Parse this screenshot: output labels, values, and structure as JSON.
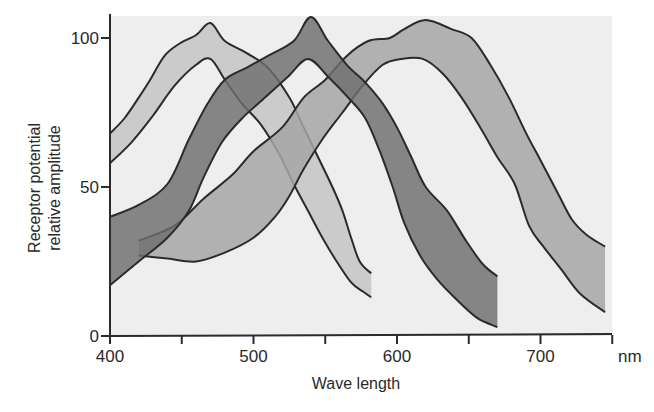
{
  "chart_data": {
    "type": "area",
    "title": "",
    "xlabel": "Wave length",
    "xunit": "nm",
    "ylabel": [
      "Receptor potential",
      "relative amplitude"
    ],
    "xlim": [
      400,
      750
    ],
    "ylim": [
      0,
      105
    ],
    "xticks": [
      400,
      450,
      500,
      550,
      600,
      650,
      700,
      750
    ],
    "xtick_labels": [
      "400",
      "500",
      "600",
      "700"
    ],
    "xtick_label_values": [
      400,
      500,
      600,
      700
    ],
    "yticks": [
      0,
      50,
      100
    ],
    "ytick_labels": [
      "0",
      "50",
      "100"
    ],
    "grid": false,
    "legend": null,
    "series": [
      {
        "name": "short-wavelength receptor band",
        "peak_nm": 470,
        "fill": "#c4c4c4",
        "upper": [
          [
            400,
            68
          ],
          [
            410,
            73
          ],
          [
            420,
            80
          ],
          [
            428,
            86
          ],
          [
            438,
            94
          ],
          [
            448,
            98
          ],
          [
            460,
            101
          ],
          [
            470,
            105
          ],
          [
            480,
            99
          ],
          [
            495,
            95
          ],
          [
            510,
            90
          ],
          [
            525,
            80
          ],
          [
            535,
            70
          ],
          [
            545,
            60
          ],
          [
            555,
            50
          ],
          [
            562,
            42
          ],
          [
            568,
            33
          ],
          [
            574,
            25
          ],
          [
            582,
            21
          ]
        ],
        "lower": [
          [
            400,
            58
          ],
          [
            415,
            65
          ],
          [
            430,
            74
          ],
          [
            445,
            84
          ],
          [
            460,
            91
          ],
          [
            470,
            93
          ],
          [
            480,
            86
          ],
          [
            492,
            78
          ],
          [
            505,
            71
          ],
          [
            518,
            61
          ],
          [
            528,
            51
          ],
          [
            538,
            42
          ],
          [
            548,
            33
          ],
          [
            558,
            25
          ],
          [
            568,
            18
          ],
          [
            576,
            15
          ],
          [
            582,
            13
          ]
        ]
      },
      {
        "name": "middle-wavelength receptor band",
        "peak_nm": 540,
        "fill": "#6e6e6e",
        "upper": [
          [
            400,
            40
          ],
          [
            420,
            44
          ],
          [
            440,
            51
          ],
          [
            455,
            66
          ],
          [
            468,
            78
          ],
          [
            480,
            86
          ],
          [
            495,
            90
          ],
          [
            510,
            94
          ],
          [
            528,
            99
          ],
          [
            540,
            107
          ],
          [
            552,
            99
          ],
          [
            565,
            91
          ],
          [
            578,
            85
          ],
          [
            590,
            78
          ],
          [
            600,
            70
          ],
          [
            610,
            60
          ],
          [
            620,
            50
          ],
          [
            635,
            42
          ],
          [
            648,
            32
          ],
          [
            660,
            24
          ],
          [
            670,
            20
          ]
        ],
        "lower": [
          [
            400,
            17
          ],
          [
            420,
            25
          ],
          [
            440,
            33
          ],
          [
            455,
            42
          ],
          [
            465,
            53
          ],
          [
            478,
            65
          ],
          [
            492,
            73
          ],
          [
            508,
            80
          ],
          [
            524,
            87
          ],
          [
            538,
            93
          ],
          [
            552,
            87
          ],
          [
            566,
            80
          ],
          [
            578,
            73
          ],
          [
            588,
            62
          ],
          [
            597,
            50
          ],
          [
            605,
            38
          ],
          [
            616,
            27
          ],
          [
            628,
            19
          ],
          [
            642,
            12
          ],
          [
            656,
            6
          ],
          [
            670,
            3
          ]
        ]
      },
      {
        "name": "long-wavelength receptor band",
        "peak_nm": 620,
        "fill": "#a6a6a6",
        "upper": [
          [
            420,
            32
          ],
          [
            445,
            37
          ],
          [
            465,
            46
          ],
          [
            485,
            54
          ],
          [
            500,
            62
          ],
          [
            520,
            70
          ],
          [
            535,
            80
          ],
          [
            550,
            86
          ],
          [
            565,
            94
          ],
          [
            580,
            99
          ],
          [
            595,
            100
          ],
          [
            605,
            103
          ],
          [
            620,
            106
          ],
          [
            638,
            103
          ],
          [
            652,
            100
          ],
          [
            665,
            91
          ],
          [
            678,
            80
          ],
          [
            690,
            68
          ],
          [
            700,
            59
          ],
          [
            712,
            48
          ],
          [
            722,
            39
          ],
          [
            732,
            34
          ],
          [
            745,
            30
          ]
        ],
        "lower": [
          [
            420,
            27
          ],
          [
            440,
            26
          ],
          [
            460,
            25
          ],
          [
            480,
            28
          ],
          [
            500,
            33
          ],
          [
            515,
            40
          ],
          [
            525,
            47
          ],
          [
            535,
            56
          ],
          [
            548,
            66
          ],
          [
            562,
            75
          ],
          [
            576,
            84
          ],
          [
            590,
            91
          ],
          [
            603,
            93
          ],
          [
            618,
            93
          ],
          [
            632,
            88
          ],
          [
            645,
            80
          ],
          [
            658,
            70
          ],
          [
            670,
            60
          ],
          [
            682,
            51
          ],
          [
            692,
            37
          ],
          [
            702,
            30
          ],
          [
            715,
            22
          ],
          [
            728,
            14
          ],
          [
            745,
            8
          ]
        ]
      }
    ]
  },
  "colors": {
    "plot_background": "#eeeeee",
    "outline": "#2b2b2b",
    "text": "#2a2a2a"
  }
}
